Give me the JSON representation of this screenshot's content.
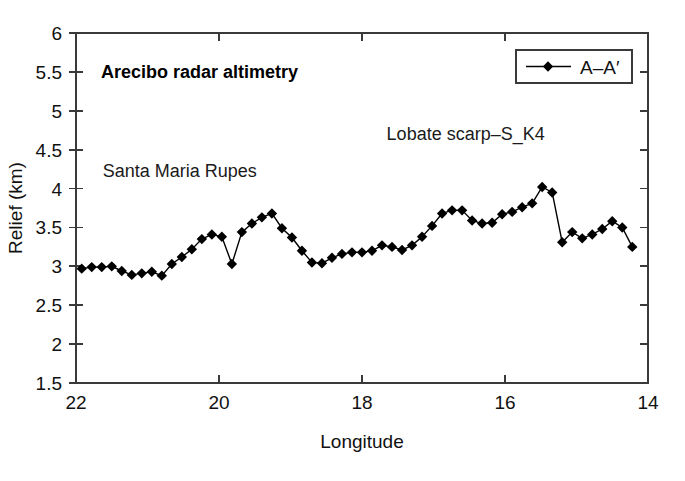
{
  "figure": {
    "background_color": "#ffffff",
    "frame_color": "#3a3a3a",
    "series_color": "#000000"
  },
  "title": "Arecibo radar altimetry",
  "legend": {
    "position": "top-right",
    "entries": [
      {
        "label": "A–A′",
        "marker": "diamond",
        "color": "#000000"
      }
    ]
  },
  "annotations": [
    {
      "name": "santa-maria-rupes",
      "text": "Santa Maria Rupes",
      "x": 20.55,
      "y": 4.15
    },
    {
      "name": "lobate-scarp",
      "text": "Lobate scarp–S_K4",
      "x": 16.55,
      "y": 4.62
    }
  ],
  "axes": {
    "x": {
      "label": "Longitude",
      "ticks": [
        "22",
        "20",
        "18",
        "16",
        "14"
      ],
      "tick_values": [
        22,
        20,
        18,
        16,
        14
      ],
      "min": 22,
      "max": 14,
      "reversed": true
    },
    "y": {
      "label": "Relief (km)",
      "ticks": [
        "1.5",
        "2",
        "2.5",
        "3",
        "3.5",
        "4",
        "4.5",
        "5",
        "5.5",
        "6"
      ],
      "tick_values": [
        1.5,
        2,
        2.5,
        3,
        3.5,
        4,
        4.5,
        5,
        5.5,
        6
      ],
      "min": 1.5,
      "max": 6
    }
  },
  "chart_data": {
    "type": "line",
    "title": "Arecibo radar altimetry",
    "xlabel": "Longitude",
    "ylabel": "Relief (km)",
    "xlim": [
      22,
      14
    ],
    "ylim": [
      1.5,
      6
    ],
    "grid": false,
    "legend_position": "top-right",
    "x_axis_reversed": true,
    "series": [
      {
        "name": "A–A′",
        "marker": "diamond",
        "color": "#000000",
        "x": [
          21.92,
          21.78,
          21.64,
          21.5,
          21.36,
          21.22,
          21.08,
          20.94,
          20.8,
          20.66,
          20.52,
          20.38,
          20.24,
          20.1,
          19.96,
          19.82,
          19.68,
          19.54,
          19.4,
          19.26,
          19.12,
          18.98,
          18.84,
          18.7,
          18.56,
          18.42,
          18.28,
          18.14,
          18.0,
          17.86,
          17.72,
          17.58,
          17.44,
          17.3,
          17.16,
          17.02,
          16.88,
          16.74,
          16.6,
          16.46,
          16.32,
          16.18,
          16.04,
          15.9,
          15.76,
          15.62,
          15.48,
          15.34,
          15.2,
          15.06,
          14.92,
          14.78,
          14.64,
          14.5,
          14.36,
          14.22
        ],
        "y": [
          2.97,
          2.99,
          2.99,
          3.0,
          2.94,
          2.89,
          2.91,
          2.93,
          2.88,
          3.03,
          3.12,
          3.22,
          3.35,
          3.41,
          3.38,
          3.03,
          3.44,
          3.55,
          3.63,
          3.68,
          3.49,
          3.37,
          3.2,
          3.05,
          3.04,
          3.11,
          3.16,
          3.18,
          3.18,
          3.2,
          3.27,
          3.25,
          3.21,
          3.27,
          3.38,
          3.52,
          3.68,
          3.72,
          3.72,
          3.59,
          3.55,
          3.56,
          3.67,
          3.7,
          3.76,
          3.81,
          4.02,
          3.95,
          3.31,
          3.44,
          3.36,
          3.41,
          3.48,
          3.58,
          3.5,
          3.25
        ]
      }
    ]
  }
}
